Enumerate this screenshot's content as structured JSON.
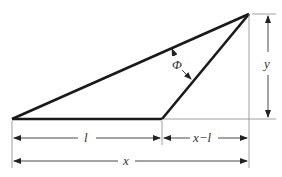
{
  "diagram": {
    "type": "geometry-triangle",
    "labels": {
      "angle": "Φ",
      "height": "y",
      "base_segment": "l",
      "offset_segment": "x−l",
      "total_width": "x"
    },
    "colors": {
      "outline": "#1a1a1a",
      "dimension": "#555555",
      "text": "#333333"
    }
  }
}
